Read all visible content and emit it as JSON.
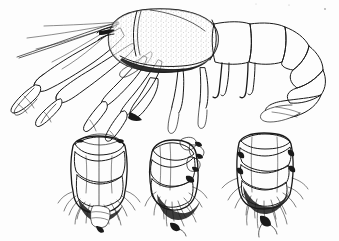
{
  "figure": {
    "medium": "stippled line drawing",
    "background_color": "#fdfdfd",
    "ink_color": "#1a1a1a",
    "caption": "",
    "labels": []
  },
  "panels": [
    {
      "id": "habitus",
      "name": "lateral habitus of decapod crustacean",
      "view": "lateral",
      "parts": [
        {
          "name": "antenna",
          "count": 2
        },
        {
          "name": "antennule",
          "count": 1
        },
        {
          "name": "cheliped",
          "count": 2
        },
        {
          "name": "carapace",
          "count": 1
        },
        {
          "name": "rostrum",
          "count": 1
        },
        {
          "name": "pereopod",
          "count": 4
        },
        {
          "name": "abdomen-somite",
          "count": 6
        },
        {
          "name": "uropod",
          "count": 2
        },
        {
          "name": "telson",
          "count": 1
        }
      ]
    },
    {
      "id": "abdomen-dorsal",
      "name": "abdomen dorsal view with pleopods",
      "view": "dorsal",
      "somite_count": 5
    },
    {
      "id": "abdomen-lateral",
      "name": "abdomen lateral view with pleopods",
      "view": "lateral",
      "somite_count": 5
    },
    {
      "id": "abdomen-ventral",
      "name": "abdomen ventral view with pleopods",
      "view": "ventral",
      "somite_count": 6
    }
  ]
}
